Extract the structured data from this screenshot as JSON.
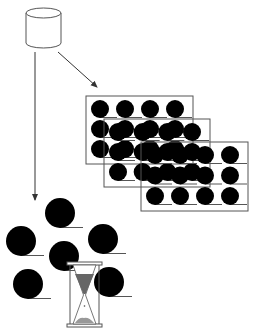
{
  "diagram": {
    "colors": {
      "stroke": "#555555",
      "fill_dark": "#000000",
      "panel_fill": "#ffffff",
      "background": "#ffffff"
    },
    "database": {
      "icon": "database-cylinder-icon",
      "x": 26,
      "y": 6,
      "width": 35,
      "height": 38
    },
    "arrows": [
      {
        "name": "arrow-to-batches",
        "x1": 58,
        "y1": 52,
        "x2": 98,
        "y2": 88
      },
      {
        "name": "arrow-to-pool",
        "x1": 35,
        "y1": 52,
        "x2": 35,
        "y2": 202
      }
    ],
    "batch_panels": [
      {
        "x": 86,
        "y": 96,
        "width": 107,
        "height": 68,
        "rows": 3,
        "cols": 4
      },
      {
        "x": 104,
        "y": 119,
        "width": 106,
        "height": 68,
        "rows": 3,
        "cols": 4
      },
      {
        "x": 141,
        "y": 142,
        "width": 107,
        "height": 69,
        "rows": 3,
        "cols": 4
      }
    ],
    "pool_items": [
      {
        "cx": 60,
        "cy": 213,
        "r": 15
      },
      {
        "cx": 21,
        "cy": 241,
        "r": 15
      },
      {
        "cx": 103,
        "cy": 239,
        "r": 15
      },
      {
        "cx": 64,
        "cy": 256,
        "r": 15
      },
      {
        "cx": 28,
        "cy": 284,
        "r": 15
      },
      {
        "cx": 109,
        "cy": 282,
        "r": 15
      }
    ],
    "hourglass": {
      "icon": "hourglass-icon",
      "x": 67,
      "y": 262,
      "width": 35,
      "height": 65
    }
  }
}
